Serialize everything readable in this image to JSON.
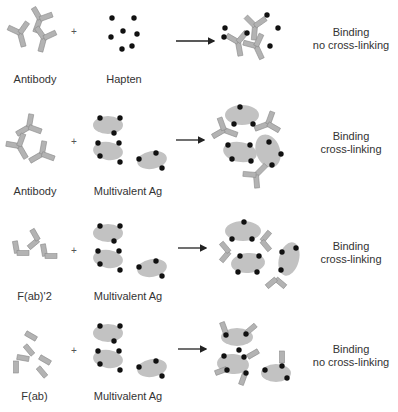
{
  "colors": {
    "fragment": "#b3b3b3",
    "fragment_edge": "#8c8c8c",
    "antigen": "#c2c2c2",
    "hapten": "#111111",
    "arrow": "#222222",
    "text": "#333333"
  },
  "rows": [
    {
      "reactant1": "Antibody",
      "operator": "+",
      "reactant2": "Hapten",
      "result_line1": "Binding",
      "result_line2": "no cross-linking"
    },
    {
      "reactant1": "Antibody",
      "operator": "+",
      "reactant2": "Multivalent Ag",
      "result_line1": "Binding",
      "result_line2": "cross-linking"
    },
    {
      "reactant1": "F(ab)'2",
      "operator": "+",
      "reactant2": "Multivalent Ag",
      "result_line1": "Binding",
      "result_line2": "cross-linking"
    },
    {
      "reactant1": "F(ab)",
      "operator": "+",
      "reactant2": "Multivalent Ag",
      "result_line1": "Binding",
      "result_line2": "no cross-linking"
    }
  ],
  "icons": {
    "antibody": "y-shaped-antibody-icon",
    "fab2": "v-shaped-fab2-icon",
    "fab": "rectangle-fab-icon",
    "hapten": "dot-icon",
    "antigen": "ellipse-antigen-icon",
    "arrow": "right-arrow-icon"
  }
}
